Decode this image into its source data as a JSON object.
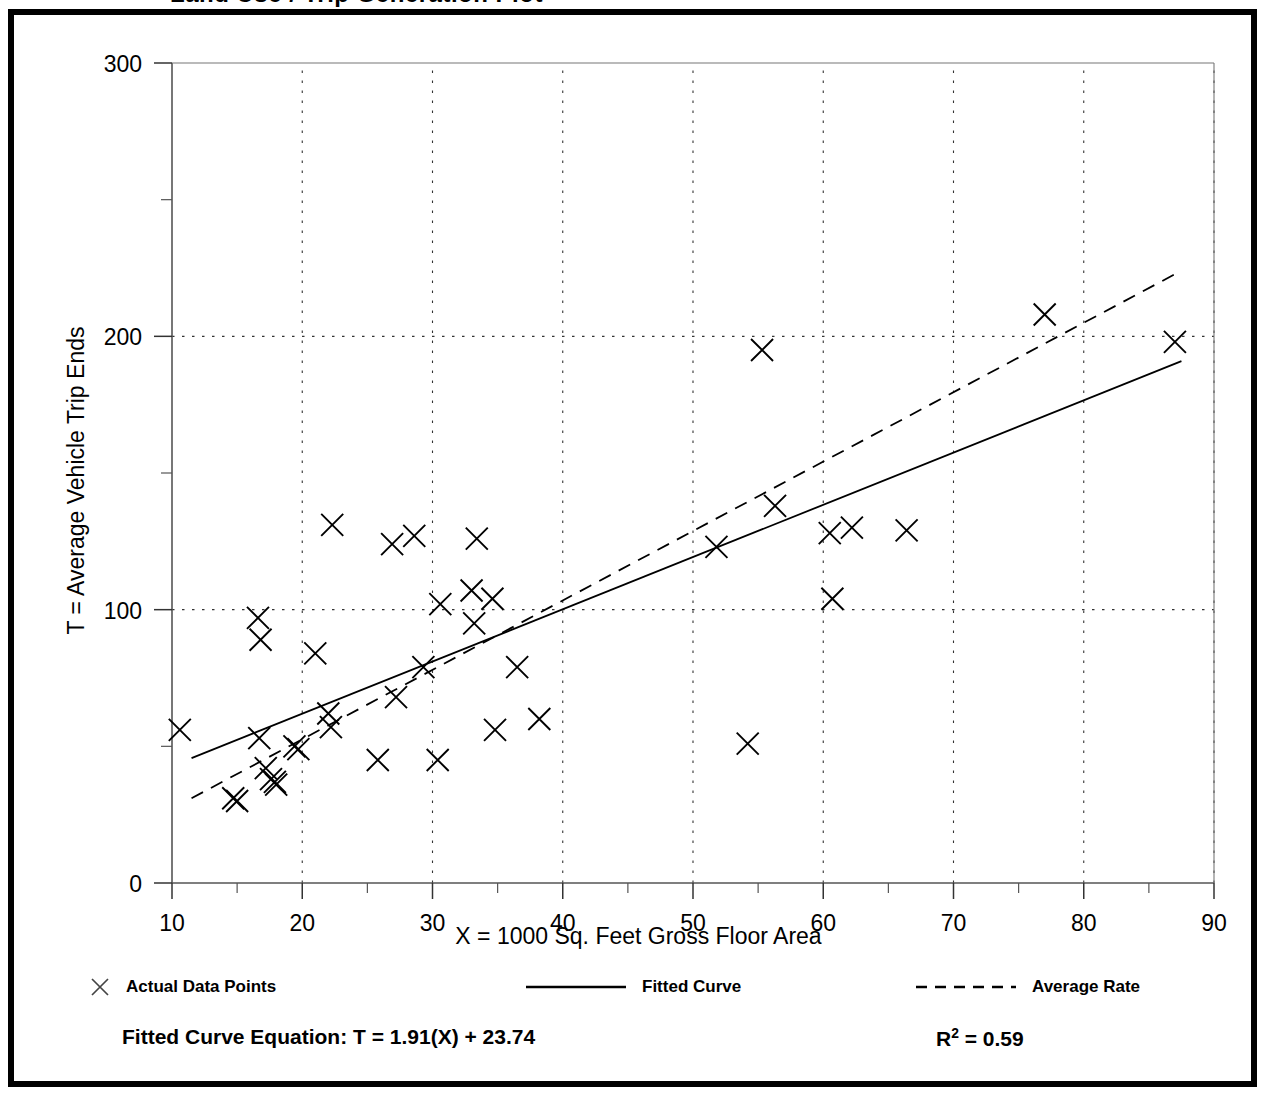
{
  "figure": {
    "title_partial": "Land Use / Trip Generation Plot",
    "background_color": "#ffffff",
    "frame_color": "#000000"
  },
  "axes": {
    "y_title": "T = Average Vehicle Trip Ends",
    "x_title": "X = 1000 Sq. Feet Gross Floor Area",
    "x_ticks": [
      "10",
      "20",
      "30",
      "40",
      "50",
      "60",
      "70",
      "80",
      "90"
    ],
    "y_ticks": [
      "0",
      "100",
      "200",
      "300"
    ]
  },
  "legend": {
    "items": [
      {
        "label": "Actual Data Points",
        "marker": "x-marker-icon"
      },
      {
        "label": "Fitted Curve",
        "marker": "solid-line-icon"
      },
      {
        "label": "Average Rate",
        "marker": "dashed-line-icon"
      }
    ]
  },
  "annotations": {
    "equation": "Fitted Curve Equation:  T = 1.91(X) + 23.74",
    "r_squared_prefix": "R",
    "r_squared_sup": "2",
    "r_squared_value": " = 0.59"
  },
  "chart_data": {
    "type": "scatter",
    "title": "",
    "xlabel": "X = 1000 Sq. Feet Gross Floor Area",
    "ylabel": "T = Average Vehicle Trip Ends",
    "xlim": [
      10,
      90
    ],
    "ylim": [
      0,
      300
    ],
    "x_ticks": [
      10,
      20,
      30,
      40,
      50,
      60,
      70,
      80,
      90
    ],
    "y_ticks": [
      0,
      100,
      200,
      300
    ],
    "x_minor_ticks": [
      15,
      25,
      35,
      45,
      55,
      65,
      75,
      85
    ],
    "y_minor_ticks": [
      50,
      150,
      250
    ],
    "grid": true,
    "grid_style": "dotted",
    "legend_position": "below-plot",
    "series": [
      {
        "name": "Actual Data Points",
        "type": "scatter",
        "marker": "x",
        "color": "#000000",
        "points": [
          [
            10.6,
            56
          ],
          [
            14.7,
            31
          ],
          [
            15.0,
            30
          ],
          [
            16.6,
            97
          ],
          [
            16.8,
            89
          ],
          [
            16.7,
            53
          ],
          [
            17.2,
            42
          ],
          [
            17.6,
            38
          ],
          [
            17.9,
            37
          ],
          [
            18.0,
            36
          ],
          [
            19.4,
            50
          ],
          [
            19.7,
            49
          ],
          [
            21.0,
            84
          ],
          [
            22.0,
            62
          ],
          [
            22.2,
            57
          ],
          [
            22.3,
            131
          ],
          [
            25.8,
            45
          ],
          [
            26.9,
            124
          ],
          [
            27.2,
            68
          ],
          [
            28.6,
            127
          ],
          [
            29.3,
            79
          ],
          [
            30.4,
            45
          ],
          [
            30.6,
            102
          ],
          [
            33.0,
            107
          ],
          [
            33.2,
            95
          ],
          [
            33.4,
            126
          ],
          [
            34.6,
            104
          ],
          [
            34.8,
            56
          ],
          [
            36.5,
            79
          ],
          [
            38.2,
            60
          ],
          [
            51.8,
            123
          ],
          [
            54.2,
            51
          ],
          [
            55.3,
            195
          ],
          [
            56.3,
            138
          ],
          [
            60.5,
            128
          ],
          [
            60.7,
            104
          ],
          [
            62.2,
            130
          ],
          [
            66.4,
            129
          ],
          [
            77.0,
            208
          ],
          [
            87.0,
            198
          ]
        ]
      },
      {
        "name": "Fitted Curve",
        "type": "line",
        "style": "solid",
        "color": "#000000",
        "equation": "T = 1.91(X) + 23.74",
        "slope": 1.91,
        "intercept": 23.74,
        "r_squared": 0.59,
        "x_range": [
          11.5,
          87.5
        ],
        "endpoints": [
          [
            11.5,
            45.7
          ],
          [
            87.5,
            190.9
          ]
        ]
      },
      {
        "name": "Average Rate",
        "type": "line",
        "style": "dashed",
        "color": "#000000",
        "x_range": [
          11.5,
          87.5
        ],
        "endpoints": [
          [
            11.5,
            31.0
          ],
          [
            87.5,
            224.0
          ]
        ]
      }
    ]
  }
}
